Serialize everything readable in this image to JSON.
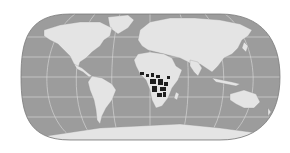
{
  "map": {
    "projection": "pseudocylindrical world map (rounded edges)",
    "colors": {
      "background": "#ffffff",
      "ocean": "#9c9c9c",
      "land": "#e4e4e4",
      "graticule": "#d8d8d8",
      "outline": "#7a7a7a",
      "highlight": "#1e1e1e"
    },
    "highlighted_region": "Central Africa (dark patches)",
    "graticule": true,
    "labels": []
  }
}
